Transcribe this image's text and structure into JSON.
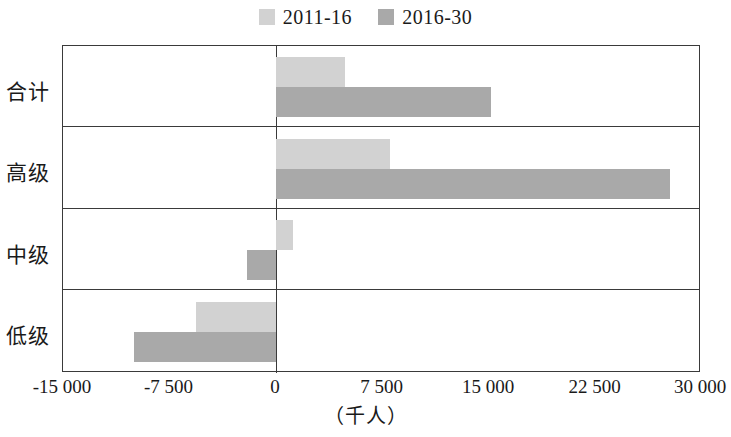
{
  "chart_data": {
    "type": "bar",
    "orientation": "horizontal",
    "title": "",
    "xlabel": "（千人）",
    "ylabel": "",
    "categories": [
      "合计",
      "高级",
      "中级",
      "低级"
    ],
    "series": [
      {
        "name": "2011-16",
        "color": "#d2d2d2",
        "values": [
          4900,
          8100,
          1200,
          -5600
        ]
      },
      {
        "name": "2016-30",
        "color": "#a9a9a9",
        "values": [
          15200,
          27800,
          -2000,
          -10000
        ]
      }
    ],
    "xlim": [
      -15000,
      30000
    ],
    "xticks": [
      -15000,
      -7500,
      0,
      7500,
      15000,
      22500,
      30000
    ],
    "xtick_labels": [
      "-15 000",
      "-7 500",
      "0",
      "7 500",
      "15 000",
      "22 500",
      "30 000"
    ],
    "grid": false,
    "legend_position": "top-center",
    "zero_line": 0
  },
  "legend": {
    "entries": [
      {
        "label": "2011-16",
        "color": "#d2d2d2",
        "swatch_name": "legend-swatch-2011-16"
      },
      {
        "label": "2016-30",
        "color": "#a9a9a9",
        "swatch_name": "legend-swatch-2016-30"
      }
    ]
  },
  "axis": {
    "x_title": "（千人）",
    "ticks": [
      "-15 000",
      "-7 500",
      "0",
      "7 500",
      "15 000",
      "22 500",
      "30 000"
    ]
  },
  "categories": {
    "total": "合计",
    "high": "高级",
    "medium": "中级",
    "low": "低级"
  },
  "colors": {
    "series_light": "#d2d2d2",
    "series_dark": "#a9a9a9",
    "axis": "#3a3a3a",
    "text": "#1a1a1a",
    "background": "#ffffff"
  }
}
